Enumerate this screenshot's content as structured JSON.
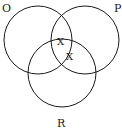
{
  "diagram": {
    "type": "venn",
    "sets": [
      {
        "label": "O",
        "cx": 38,
        "cy": 40,
        "r": 34,
        "label_x": 2,
        "label_y": 12
      },
      {
        "label": "P",
        "cx": 85,
        "cy": 40,
        "r": 34,
        "label_x": 115,
        "label_y": 12
      },
      {
        "label": "R",
        "cx": 62,
        "cy": 73,
        "r": 34,
        "label_x": 57,
        "label_y": 127
      }
    ],
    "marks": [
      {
        "text": "X",
        "region": "O∩P∩R (top)",
        "x": 58,
        "y": 45
      },
      {
        "text": "X",
        "region": "P∩R",
        "x": 66,
        "y": 60
      }
    ],
    "stroke_color": "#1a1a1a",
    "background": "#ffffff"
  }
}
